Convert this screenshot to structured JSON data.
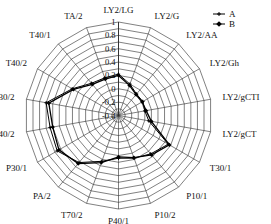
{
  "chart_data": {
    "type": "radar",
    "title": "",
    "xlabel": "",
    "ylabel": "",
    "grid": true,
    "legend_position": "top-right",
    "rlim": [
      -0.4,
      1.0
    ],
    "tick_labels": [
      "1",
      "0.8",
      "0.6",
      "0.4",
      "0.2",
      "0",
      "-0.2",
      "-0.4"
    ],
    "tick_values": [
      1,
      0.8,
      0.6,
      0.4,
      0.2,
      0,
      -0.2,
      -0.4
    ],
    "categories": [
      "LY2/LG",
      "LY2/G",
      "LY2/AA",
      "LY2/Gh",
      "LY2/gCTI",
      "LY2/gCT",
      "T30/1",
      "P10/1",
      "P10/2",
      "P40/1",
      "T70/2",
      "PA/2",
      "P30/1",
      "P40/2",
      "P30/2",
      "T40/2",
      "T40/1",
      "TA/2"
    ],
    "series": [
      {
        "name": "A",
        "marker": "small-cross",
        "values": [
          0.22,
          0.1,
          0.02,
          0.02,
          0.0,
          0.06,
          0.46,
          0.35,
          0.28,
          0.24,
          0.33,
          0.52,
          0.66,
          0.64,
          0.7,
          0.4,
          0.23,
          0.2
        ]
      },
      {
        "name": "B",
        "marker": "filled-diamond",
        "values": [
          0.2,
          0.08,
          0.01,
          0.01,
          0.02,
          0.1,
          0.48,
          0.37,
          0.27,
          0.22,
          0.35,
          0.54,
          0.63,
          0.6,
          0.66,
          0.38,
          0.21,
          0.18
        ]
      }
    ],
    "legend": [
      {
        "name": "A",
        "label": "A"
      },
      {
        "name": "B",
        "label": "B"
      }
    ],
    "colors": {
      "series_a": "#000000",
      "series_b": "#000000",
      "grid": "#2b2b2b",
      "background": "#ffffff"
    }
  }
}
